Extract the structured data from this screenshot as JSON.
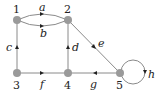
{
  "diagram": {
    "type": "directed-graph",
    "vertices": [
      {
        "id": "1",
        "label": "1",
        "x": 17,
        "y": 20
      },
      {
        "id": "2",
        "label": "2",
        "x": 68,
        "y": 20
      },
      {
        "id": "3",
        "label": "3",
        "x": 17,
        "y": 73
      },
      {
        "id": "4",
        "label": "4",
        "x": 68,
        "y": 73
      },
      {
        "id": "5",
        "label": "5",
        "x": 120,
        "y": 73
      }
    ],
    "edges": [
      {
        "label": "a",
        "from": "1",
        "to": "2",
        "shape": "upper-arc"
      },
      {
        "label": "b",
        "from": "1",
        "to": "2",
        "shape": "lower-arc"
      },
      {
        "label": "c",
        "from": "3",
        "to": "1"
      },
      {
        "label": "d",
        "from": "4",
        "to": "2"
      },
      {
        "label": "e",
        "from": "2",
        "to": "5"
      },
      {
        "label": "f",
        "from": "3",
        "to": "4"
      },
      {
        "label": "g",
        "from": "5",
        "to": "4"
      },
      {
        "label": "h",
        "from": "5",
        "to": "5",
        "shape": "loop"
      }
    ],
    "colors": {
      "vertex": "#9a9a9a",
      "edge": "#8a8a8a",
      "text": "#222222"
    }
  }
}
